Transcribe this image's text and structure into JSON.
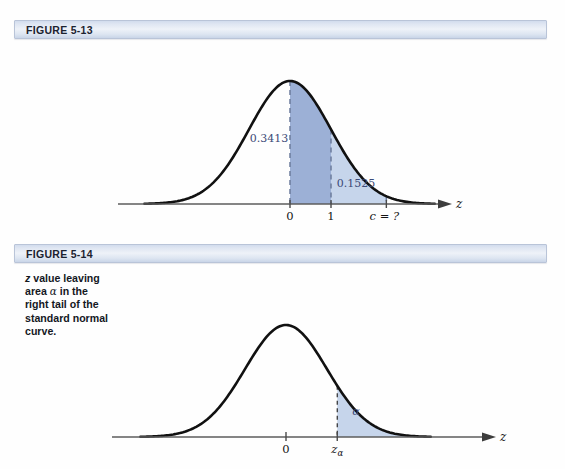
{
  "figure1": {
    "header_label": "FIGURE 5-13",
    "axis_name": "z",
    "ticks": [
      {
        "label": "0",
        "z": 0
      },
      {
        "label": "1",
        "z": 1
      },
      {
        "label": "c = ?",
        "z": 2.35
      }
    ],
    "areas": [
      {
        "label": "0.3413",
        "from_z": 0,
        "to_z": 1,
        "color": "#9cb0d6"
      },
      {
        "label": "0.1525",
        "from_z": 1,
        "to_z": 2.35,
        "color": "#c6d5eb"
      }
    ]
  },
  "figure2": {
    "header_label": "FIGURE 5-14",
    "caption_line1": "z value leaving",
    "caption_line2_pre": "area ",
    "caption_line2_sym": "α",
    "caption_line2_post": " in the",
    "caption_line3": "right tail of the",
    "caption_line4": "standard normal",
    "caption_line5": "curve.",
    "axis_name": "z",
    "ticks": [
      {
        "label": "0",
        "z": 0
      },
      {
        "label": "zα",
        "z": 1.25
      }
    ],
    "areas": [
      {
        "label": "α",
        "from_z": 1.25,
        "to_z": 4.0,
        "color": "#c6d5eb"
      }
    ]
  },
  "chart_data": {
    "type": "area",
    "charts": [
      {
        "id": "figure-5-13",
        "title": "FIGURE 5-13",
        "xlabel": "z",
        "ylabel": "",
        "distribution": "standard normal",
        "mean": 0,
        "sd": 1,
        "xlim": [
          -3.6,
          3.6
        ],
        "grid": false,
        "legend": "none",
        "tick_values": [
          0,
          1,
          2.35
        ],
        "tick_labels": [
          "0",
          "1",
          "c = ?"
        ],
        "shaded_regions": [
          {
            "from": 0,
            "to": 1,
            "area": 0.3413,
            "label": "0.3413",
            "color": "#9cb0d6"
          },
          {
            "from": 1,
            "to": 2.35,
            "area": 0.1525,
            "label": "0.1525",
            "color": "#c6d5eb"
          }
        ],
        "annotations": [
          "0.3413",
          "0.1525",
          "c = ?"
        ]
      },
      {
        "id": "figure-5-14",
        "title": "FIGURE 5-14",
        "xlabel": "z",
        "ylabel": "",
        "distribution": "standard normal",
        "mean": 0,
        "sd": 1,
        "xlim": [
          -3.6,
          3.6
        ],
        "grid": false,
        "legend": "none",
        "tick_values": [
          0,
          1.25
        ],
        "tick_labels": [
          "0",
          "zα"
        ],
        "shaded_regions": [
          {
            "from": 1.25,
            "to": 4.0,
            "area": null,
            "label": "α",
            "color": "#c6d5eb"
          }
        ],
        "annotations": [
          "α"
        ]
      }
    ]
  }
}
